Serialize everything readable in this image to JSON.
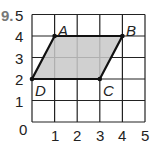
{
  "problem_number": "9.",
  "grid": {
    "x_min": 0,
    "x_max": 5,
    "y_min": 0,
    "y_max": 5
  },
  "x_ticks": [
    "0",
    "1",
    "2",
    "3",
    "4",
    "5"
  ],
  "y_ticks": [
    "1",
    "2",
    "3",
    "4",
    "5"
  ],
  "points": [
    {
      "label": "A",
      "x": 1,
      "y": 4
    },
    {
      "label": "B",
      "x": 4,
      "y": 4
    },
    {
      "label": "C",
      "x": 3,
      "y": 2
    },
    {
      "label": "D",
      "x": 0,
      "y": 2
    }
  ],
  "shape": {
    "type": "parallelogram",
    "vertices": [
      "A",
      "B",
      "C",
      "D"
    ],
    "fill": "#c8c8c8"
  }
}
